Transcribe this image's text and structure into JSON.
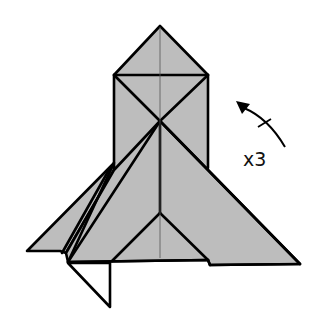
{
  "diagram": {
    "type": "origami-fold-step",
    "fill_color": "#bdbdbd",
    "line_color": "#000000",
    "background": "#ffffff",
    "annotation": {
      "repeat_label": "x3",
      "arrow": "curved-rotate-arrow-icon",
      "meaning": "repeat step 3 times"
    }
  }
}
